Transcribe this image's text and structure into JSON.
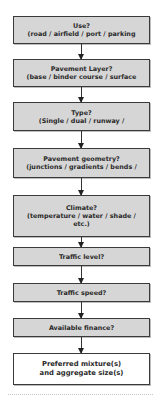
{
  "flowchart": {
    "steps": [
      {
        "title": "Use?",
        "detail": [
          "(road / airfield / port / parking"
        ]
      },
      {
        "title": "Pavement Layer?",
        "detail": [
          "(base / binder course / surface"
        ]
      },
      {
        "title": "Type?",
        "detail": [
          "(Single / dual / runway /"
        ]
      },
      {
        "title": "Pavement geometry?",
        "detail": [
          "(junctions / gradients / bends /"
        ]
      },
      {
        "title": "Climate?",
        "detail": [
          "(temperature / water / shade /",
          "etc.)"
        ]
      },
      {
        "title": "Traffic level?",
        "detail": []
      },
      {
        "title": "Traffic speed?",
        "detail": []
      },
      {
        "title": "Available finance?",
        "detail": []
      },
      {
        "title": "Preferred mixture(s)",
        "detail": [
          "and aggregate size(s)"
        ]
      }
    ],
    "colors": {
      "step_fill": "#d6d6d6",
      "final_fill": "#ffffff",
      "border": "#3a3a3a"
    }
  }
}
